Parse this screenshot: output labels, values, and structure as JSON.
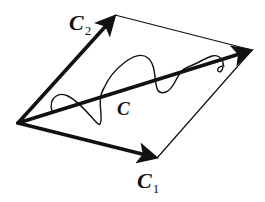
{
  "diagram": {
    "type": "vector-parallelogram",
    "labels": {
      "c1": {
        "main": "C",
        "sub": "1"
      },
      "c2": {
        "main": "C",
        "sub": "2"
      },
      "c": {
        "main": "C"
      }
    },
    "vertices": {
      "origin": [
        18,
        123
      ],
      "c2_tip": [
        115,
        15
      ],
      "c_tip": [
        252,
        50
      ],
      "c1_tip": [
        157,
        158
      ]
    },
    "colors": {
      "stroke": "#111111",
      "background": "#ffffff"
    }
  }
}
